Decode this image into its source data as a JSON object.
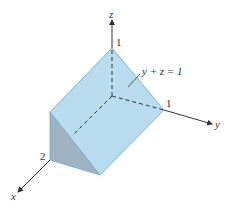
{
  "figure": {
    "colors": {
      "face_top": "#b9dcef",
      "face_side": "#9ab0c0",
      "edge": "#6aa8cf",
      "axis": "#333333",
      "background": "#ffffff"
    },
    "axes": {
      "x": {
        "label": "x",
        "tick_label": "2"
      },
      "y": {
        "label": "y",
        "tick_label": "1"
      },
      "z": {
        "label": "z",
        "tick_label": "1"
      }
    },
    "annotation": {
      "equation": "y + z = 1"
    }
  }
}
